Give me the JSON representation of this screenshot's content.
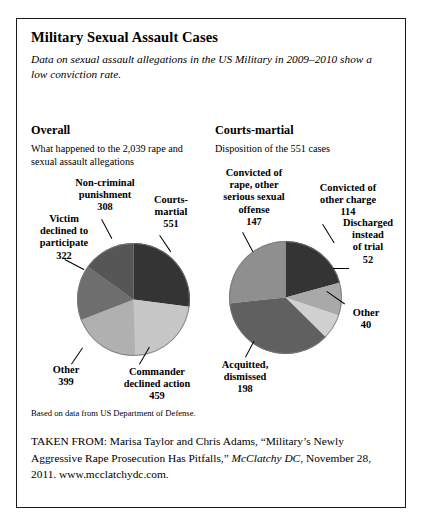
{
  "figure": {
    "title": "Military Sexual Assault Cases",
    "subtitle": "Data on sexual assault allegations in the US Military in 2009–2010 show a low conviction rate.",
    "footnote": "Based on data from US Department of Defense.",
    "source_prefix": "TAKEN FROM: Marisa Taylor and Chris Adams, “Military’s Newly Aggressive Rape Prosecution Has Pitfalls,” ",
    "source_publication": "McClatchy DC",
    "source_suffix": ", November 28, 2011. www.mcclatchydc.com."
  },
  "panels": {
    "left": {
      "heading": "Overall",
      "subheading": "What happened to the 2,039 rape and sexual assault allegations"
    },
    "right": {
      "heading": "Courts-martial",
      "subheading": "Disposition of the 551 cases"
    }
  },
  "labels": {
    "left": {
      "courts_martial_name": "Courts-",
      "courts_martial_name2": "martial",
      "courts_martial_value": "551",
      "commander_name": "Commander",
      "commander_name2": "declined action",
      "commander_value": "459",
      "other_name": "Other",
      "other_value": "399",
      "victim_name": "Victim",
      "victim_name2": "declined to",
      "victim_name3": "participate",
      "victim_value": "322",
      "noncriminal_name": "Non-criminal",
      "noncriminal_name2": "punishment",
      "noncriminal_value": "308"
    },
    "right": {
      "convicted_rape_name": "Convicted of",
      "convicted_rape_name2": "rape, other",
      "convicted_rape_name3": "serious sexual",
      "convicted_rape_name4": "offense",
      "convicted_rape_value": "147",
      "convicted_other_name": "Convicted of",
      "convicted_other_name2": "other charge",
      "convicted_other_value": "114",
      "discharged_name": "Discharged",
      "discharged_name2": "instead",
      "discharged_name3": "of trial",
      "discharged_value": "52",
      "other_name": "Other",
      "other_value": "40",
      "acquitted_name": "Acquitted,",
      "acquitted_name2": "dismissed",
      "acquitted_value": "198"
    }
  },
  "chart_data": [
    {
      "type": "pie",
      "title": "Overall",
      "subtitle": "What happened to the 2,039 rape and sexual assault allegations",
      "total": 2039,
      "categories": [
        "Courts-martial",
        "Commander declined action",
        "Other",
        "Victim declined to participate",
        "Non-criminal punishment"
      ],
      "values": [
        551,
        459,
        399,
        322,
        308
      ],
      "colors": [
        "#343434",
        "#c6c6c6",
        "#b0b0b0",
        "#6e6e6e",
        "#565656"
      ],
      "legend": "labels-with-leader-lines",
      "grid": false
    },
    {
      "type": "pie",
      "title": "Courts-martial",
      "subtitle": "Disposition of the 551 cases",
      "total": 551,
      "categories": [
        "Convicted of other charge",
        "Discharged instead of trial",
        "Other",
        "Acquitted, dismissed",
        "Convicted of rape, other serious sexual offense"
      ],
      "values": [
        114,
        52,
        40,
        198,
        147
      ],
      "colors": [
        "#343434",
        "#a9a9a9",
        "#d0d0d0",
        "#606060",
        "#8f8f8f"
      ],
      "legend": "labels-with-leader-lines",
      "grid": false
    }
  ],
  "palette": {
    "darkest": "#343434",
    "dark": "#565656",
    "mid_dark": "#6e6e6e",
    "mid": "#8f8f8f",
    "light": "#b0b0b0",
    "lightest": "#d0d0d0",
    "border": "#1a1a1a"
  }
}
